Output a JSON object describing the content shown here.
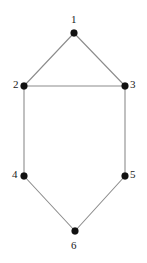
{
  "figure": {
    "type": "undirected-graph-diagram",
    "background_color": "#ffffff",
    "vertex_color": "#111111",
    "edge_color": "#8c8c8c",
    "label_color": "#1a1a1a",
    "vertex_radius": 3.4,
    "edge_width": 1.1,
    "width": 147,
    "height": 263
  },
  "graph": {
    "vertices": [
      {
        "id": "1",
        "label": "1",
        "x": 74,
        "y": 33,
        "label_x": 71,
        "label_y": 14,
        "label_anchor": "above"
      },
      {
        "id": "2",
        "label": "2",
        "x": 24,
        "y": 86,
        "label_x": 13,
        "label_y": 79,
        "label_anchor": "left"
      },
      {
        "id": "3",
        "label": "3",
        "x": 125,
        "y": 86,
        "label_x": 130,
        "label_y": 79,
        "label_anchor": "right"
      },
      {
        "id": "4",
        "label": "4",
        "x": 24,
        "y": 176,
        "label_x": 12,
        "label_y": 169,
        "label_anchor": "left"
      },
      {
        "id": "5",
        "label": "5",
        "x": 125,
        "y": 176,
        "label_x": 130,
        "label_y": 169,
        "label_anchor": "right"
      },
      {
        "id": "6",
        "label": "6",
        "x": 75,
        "y": 231,
        "label_x": 71,
        "label_y": 240,
        "label_anchor": "below"
      }
    ],
    "edges": [
      {
        "id": "edge-1-2",
        "from": "1",
        "to": "2",
        "x1": 74,
        "y1": 33,
        "x2": 24,
        "y2": 86
      },
      {
        "id": "edge-1-3",
        "from": "1",
        "to": "3",
        "x1": 74,
        "y1": 33,
        "x2": 125,
        "y2": 86
      },
      {
        "id": "edge-2-3",
        "from": "2",
        "to": "3",
        "x1": 24,
        "y1": 86,
        "x2": 125,
        "y2": 86
      },
      {
        "id": "edge-2-4",
        "from": "2",
        "to": "4",
        "x1": 24,
        "y1": 86,
        "x2": 24,
        "y2": 176
      },
      {
        "id": "edge-3-5",
        "from": "3",
        "to": "5",
        "x1": 125,
        "y1": 86,
        "x2": 125,
        "y2": 176
      },
      {
        "id": "edge-4-6",
        "from": "4",
        "to": "6",
        "x1": 24,
        "y1": 176,
        "x2": 75,
        "y2": 231
      },
      {
        "id": "edge-5-6",
        "from": "5",
        "to": "6",
        "x1": 125,
        "y1": 176,
        "x2": 75,
        "y2": 231
      }
    ]
  }
}
